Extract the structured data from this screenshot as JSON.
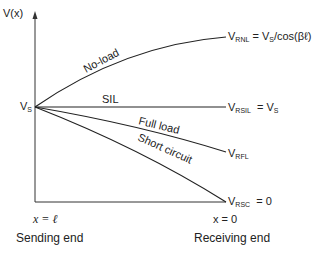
{
  "axis": {
    "y_label": "V(x)",
    "x_left_label": "x = ℓ",
    "x_right_label": "x = 0",
    "left_caption": "Sending end",
    "right_caption": "Receiving end"
  },
  "source": {
    "label": "V",
    "sub": "S"
  },
  "curves": [
    {
      "name": "No-load",
      "end_label": "V",
      "end_sub": "RNL",
      "end_expr": "= V",
      "end_expr_sub": "S",
      "end_expr_tail": "/cos(βℓ)"
    },
    {
      "name": "SIL",
      "end_label": "V",
      "end_sub": "RSIL",
      "end_expr": "= V",
      "end_expr_sub": "S"
    },
    {
      "name": "Full load",
      "end_label": "V",
      "end_sub": "RFL"
    },
    {
      "name": "Short circuit",
      "end_label": "V",
      "end_sub": "RSC",
      "end_expr": "= 0"
    }
  ],
  "colors": {
    "line": "#222222",
    "background": "#ffffff"
  }
}
